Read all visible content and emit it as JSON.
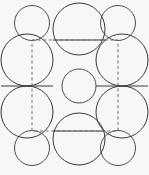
{
  "figure": {
    "background_color": "#f7f7f5",
    "stroke_color": "#3a3a3a",
    "dash_color": "#6e6e6e",
    "width": 149,
    "height": 175
  },
  "chart_data": {
    "type": "diagram",
    "xlabel": "",
    "ylabel": "",
    "xlim": [
      0,
      149
    ],
    "ylim": [
      0,
      175
    ],
    "grid": false,
    "legend": "none",
    "units": "pixels",
    "series": [
      {
        "name": "large-circles",
        "radius": 26,
        "stroke": "#3a3a3a",
        "fill": "none",
        "points": [
          {
            "id": "top-center",
            "cx": 79,
            "cy": 29
          },
          {
            "id": "left-upper",
            "cx": 27,
            "cy": 60
          },
          {
            "id": "right-upper",
            "cx": 122,
            "cy": 60
          },
          {
            "id": "left-lower",
            "cx": 27,
            "cy": 112
          },
          {
            "id": "right-lower",
            "cx": 122,
            "cy": 112
          },
          {
            "id": "bottom-center",
            "cx": 79,
            "cy": 139
          }
        ]
      },
      {
        "name": "small-corner-circles",
        "radius": 17.5,
        "stroke": "#3a3a3a",
        "fill": "none",
        "points": [
          {
            "id": "corner-top-left",
            "cx": 32,
            "cy": 23
          },
          {
            "id": "corner-top-right",
            "cx": 118,
            "cy": 23
          },
          {
            "id": "corner-bottom-left",
            "cx": 32,
            "cy": 148
          },
          {
            "id": "corner-bottom-right",
            "cx": 118,
            "cy": 148
          }
        ]
      },
      {
        "name": "center-circle",
        "radius": 17,
        "stroke": "#3a3a3a",
        "fill": "none",
        "points": [
          {
            "id": "center",
            "cx": 79,
            "cy": 86
          }
        ]
      }
    ],
    "chords": [
      {
        "id": "chord-top",
        "x1": 53,
        "y1": 40,
        "x2": 105,
        "y2": 40
      },
      {
        "id": "chord-middle-left",
        "x1": 1,
        "y1": 86,
        "x2": 53,
        "y2": 86
      },
      {
        "id": "chord-middle-right",
        "x1": 96,
        "y1": 86,
        "x2": 148,
        "y2": 86
      },
      {
        "id": "chord-bottom",
        "x1": 53,
        "y1": 131,
        "x2": 105,
        "y2": 131
      }
    ],
    "unit_cell": {
      "id": "dashed-unit-cell",
      "x": 32,
      "y": 40,
      "width": 86,
      "height": 91,
      "stroke": "#6e6e6e",
      "dash": "3 2.6"
    }
  }
}
